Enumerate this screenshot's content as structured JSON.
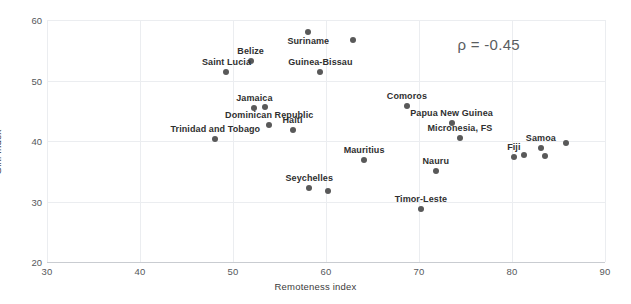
{
  "chart_data": {
    "type": "scatter",
    "title": "",
    "xlabel": "Remoteness index",
    "ylabel": "Gini Index",
    "xlim": [
      30,
      90
    ],
    "ylim": [
      20,
      60
    ],
    "xticks": [
      30,
      40,
      50,
      60,
      70,
      80,
      90
    ],
    "yticks": [
      20,
      30,
      40,
      50,
      60
    ],
    "grid": true,
    "legend": "none",
    "annotations": [
      {
        "text": "ρ = -0.45",
        "x": 77.5,
        "y": 56.0
      }
    ],
    "point_color": "#595959",
    "points": [
      {
        "label": "Suriname",
        "x": 58.1,
        "y": 58.0,
        "label_pos": "below"
      },
      {
        "label": "",
        "x": 62.9,
        "y": 56.7,
        "label_pos": "none"
      },
      {
        "label": "Belize",
        "x": 51.9,
        "y": 53.2,
        "label_pos": "above"
      },
      {
        "label": "Guinea-Bissau",
        "x": 59.4,
        "y": 51.4,
        "label_pos": "above"
      },
      {
        "label": "Saint Lucia",
        "x": 49.3,
        "y": 51.4,
        "label_pos": "above"
      },
      {
        "label": "Jamaica",
        "x": 52.3,
        "y": 45.4,
        "label_pos": "above"
      },
      {
        "label": "",
        "x": 53.4,
        "y": 45.6,
        "label_pos": "none"
      },
      {
        "label": "Comoros",
        "x": 68.7,
        "y": 45.8,
        "label_pos": "above"
      },
      {
        "label": "Dominican Republic",
        "x": 53.9,
        "y": 42.6,
        "label_pos": "above"
      },
      {
        "label": "Haiti",
        "x": 56.4,
        "y": 41.8,
        "label_pos": "above"
      },
      {
        "label": "Papua New Guinea",
        "x": 73.5,
        "y": 42.9,
        "label_pos": "above"
      },
      {
        "label": "Trinidad and Tobago",
        "x": 48.1,
        "y": 40.3,
        "label_pos": "above"
      },
      {
        "label": "Micronesia, FS",
        "x": 74.4,
        "y": 40.5,
        "label_pos": "above"
      },
      {
        "label": "",
        "x": 85.8,
        "y": 39.6,
        "label_pos": "none"
      },
      {
        "label": "Samoa",
        "x": 83.1,
        "y": 38.9,
        "label_pos": "above"
      },
      {
        "label": "",
        "x": 81.3,
        "y": 37.7,
        "label_pos": "none"
      },
      {
        "label": "",
        "x": 83.5,
        "y": 37.6,
        "label_pos": "none"
      },
      {
        "label": "Fiji",
        "x": 80.2,
        "y": 37.4,
        "label_pos": "above"
      },
      {
        "label": "Mauritius",
        "x": 64.1,
        "y": 36.8,
        "label_pos": "above"
      },
      {
        "label": "Nauru",
        "x": 71.8,
        "y": 35.1,
        "label_pos": "above"
      },
      {
        "label": "Seychelles",
        "x": 58.2,
        "y": 32.3,
        "label_pos": "above"
      },
      {
        "label": "",
        "x": 60.2,
        "y": 31.8,
        "label_pos": "none"
      },
      {
        "label": "Timor-Leste",
        "x": 70.2,
        "y": 28.8,
        "label_pos": "above"
      }
    ]
  }
}
